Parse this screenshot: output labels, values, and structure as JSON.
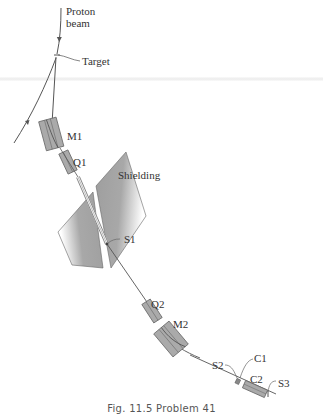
{
  "figure": {
    "caption": "Fig. 11.5   Problem 41",
    "colors": {
      "line": "#555555",
      "magnet_fill": "#a9a9a9",
      "magnet_stroke": "#6b6b6b",
      "shielding_fill": "#a6a6a6",
      "text": "#333333",
      "background": "#ffffff"
    }
  },
  "labels": {
    "proton_beam_line1": "Proton",
    "proton_beam_line2": "beam",
    "target": "Target",
    "m1": "M1",
    "q1": "Q1",
    "shielding": "Shielding",
    "s1": "S1",
    "q2": "Q2",
    "m2": "M2",
    "s2": "S2",
    "c1": "C1",
    "c2": "C2",
    "s3": "S3"
  }
}
